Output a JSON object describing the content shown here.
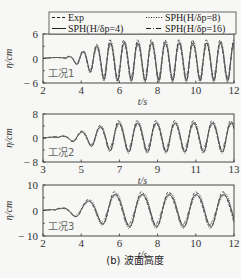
{
  "caption": "(b) 波面高度",
  "legend": {
    "items": [
      {
        "label": "Exp",
        "style": "dashed"
      },
      {
        "label": "SPH(H/δp=4)",
        "style": "solid"
      },
      {
        "label": "SPH(H/δp=8)",
        "style": "dotted"
      },
      {
        "label": "SPH(H/δp=16)",
        "style": "dashdot"
      }
    ]
  },
  "chart_data": [
    {
      "type": "line",
      "title": "工况1",
      "xlabel": "t/s",
      "ylabel": "η/cm",
      "xlim": [
        2,
        12
      ],
      "ylim": [
        -6,
        6
      ],
      "xticks": [
        2,
        4,
        6,
        8,
        10,
        12
      ],
      "yticks": [
        -6,
        0,
        6
      ],
      "wave": {
        "start": 3.2,
        "period": 0.72,
        "amp_max": 4.8,
        "ramp_end": 5.3,
        "offset": -0.4
      },
      "series": [
        "Exp",
        "SPH(H/δp=4)",
        "SPH(H/δp=8)",
        "SPH(H/δp=16)"
      ]
    },
    {
      "type": "line",
      "title": "工况2",
      "xlabel": "t/s",
      "ylabel": "η/cm",
      "xlim": [
        3,
        13
      ],
      "ylim": [
        -8,
        8
      ],
      "xticks": [
        3,
        5,
        7,
        9,
        11,
        13
      ],
      "yticks": [
        -8,
        0,
        8
      ],
      "wave": {
        "start": 3.8,
        "period": 0.98,
        "amp_max": 5.0,
        "ramp_end": 6.8,
        "offset": 0.6
      },
      "series": [
        "Exp",
        "SPH(H/δp=4)",
        "SPH(H/δp=8)",
        "SPH(H/δp=16)"
      ]
    },
    {
      "type": "line",
      "title": "工况3",
      "xlabel": "t/s",
      "ylabel": "η/cm",
      "xlim": [
        2,
        12
      ],
      "ylim": [
        -10,
        10
      ],
      "xticks": [
        2,
        4,
        6,
        8,
        10,
        12
      ],
      "yticks": [
        -10,
        0,
        10
      ],
      "wave": {
        "start": 2.6,
        "period": 1.42,
        "amp_max": 6.6,
        "ramp_end": 5.6,
        "offset": 0.5
      },
      "series": [
        "Exp",
        "SPH(H/δp=4)",
        "SPH(H/δp=8)",
        "SPH(H/δp=16)"
      ]
    }
  ]
}
